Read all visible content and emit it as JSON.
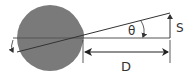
{
  "diagram": {
    "type": "eye-visual-angle",
    "labels": {
      "theta": "θ",
      "size": "S",
      "distance": "D"
    },
    "colors": {
      "eye_fill": "#7a7a7a",
      "line": "#333333",
      "axis_line": "#555555",
      "background": "#ffffff"
    }
  }
}
